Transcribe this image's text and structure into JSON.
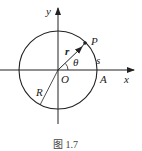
{
  "diagram": {
    "labels": {
      "y_axis": "y",
      "x_axis": "x",
      "point": "P",
      "vector": "r",
      "angle": "θ",
      "arc": "s",
      "origin": "O",
      "point_a": "A",
      "radius": "R"
    },
    "caption": "图 1.7"
  }
}
